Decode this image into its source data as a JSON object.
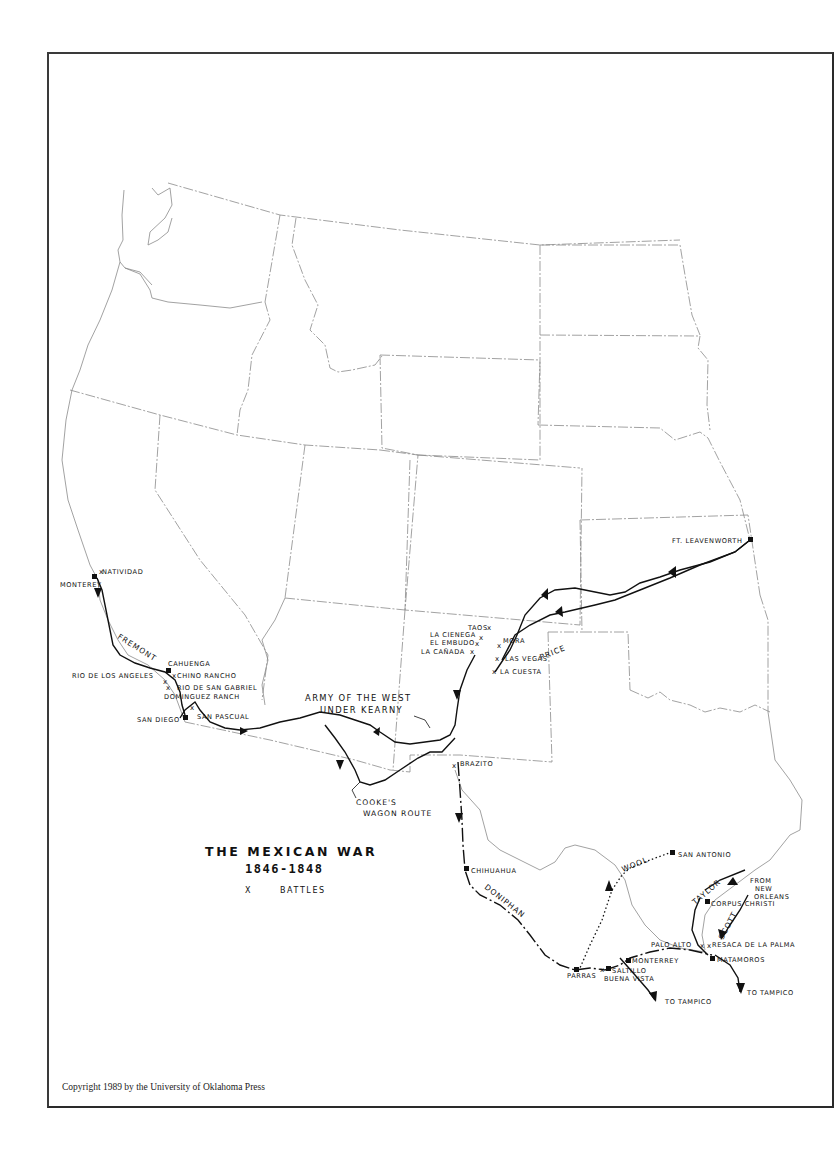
{
  "map": {
    "title": "THE MEXICAN WAR",
    "years": "1846-1848",
    "legend": {
      "battle_symbol": "X",
      "battle_label": "BATTLES"
    },
    "copyright": "Copyright 1989 by the University of Oklahoma Press"
  },
  "routes": {
    "fremont": "FREMONT",
    "army_of_the_west_line1": "ARMY OF THE WEST",
    "army_of_the_west_line2": "UNDER KEARNY",
    "price": "PRICE",
    "cookes_line1": "COOKE'S",
    "cookes_line2": "WAGON ROUTE",
    "doniphan": "DONIPHAN",
    "wool": "WOOL",
    "taylor": "TAYLOR",
    "scott": "SCOTT",
    "from_new_orleans_line1": "FROM",
    "from_new_orleans_line2": "NEW",
    "from_new_orleans_line3": "ORLEANS",
    "to_tampico_1": "TO TAMPICO",
    "to_tampico_2": "TO TAMPICO"
  },
  "places": {
    "ft_leavenworth": "FT. LEAVENWORTH",
    "natividad": "NATIVIDAD",
    "monterey": "MONTEREY",
    "cahuenga": "CAHUENGA",
    "chino_rancho": "CHINO RANCHO",
    "rio_de_los_angeles": "RIO DE LOS ANGELES",
    "rio_de_san_gabriel": "RIO DE SAN GABRIEL",
    "dominguez_ranch": "DOMINGUEZ RANCH",
    "san_diego": "SAN DIEGO",
    "san_pascual": "SAN PASCUAL",
    "taos": "TAOS",
    "la_cienega": "LA CIENEGA",
    "el_embudo": "EL EMBUDO",
    "la_canada": "LA CAÑADA",
    "mora": "MORA",
    "las_vegas": "LAS VEGAS",
    "la_cuesta": "LA CUESTA",
    "brazito": "BRAZITO",
    "chihuahua": "CHIHUAHUA",
    "san_antonio": "SAN ANTONIO",
    "corpus_christi": "CORPUS CHRISTI",
    "palo_alto": "PALO ALTO",
    "resaca_de_la_palma": "RESACA DE LA PALMA",
    "matamoros": "MATAMOROS",
    "monterrey": "MONTERREY",
    "saltillo": "SALTILLO",
    "buena_vista": "BUENA VISTA",
    "parras": "PARRAS"
  },
  "colors": {
    "ink": "#111111",
    "boundary": "#8a8a8a",
    "paper": "#ffffff",
    "frame": "#2a2a2a"
  }
}
